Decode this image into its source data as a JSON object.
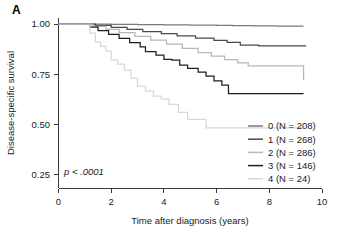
{
  "figure": {
    "panel_label": "A",
    "annotation": "p < .0001"
  },
  "chart_data": {
    "type": "line",
    "subtype": "kaplan-meier-step",
    "title": "",
    "xlabel": "Time after diagnosis (years)",
    "ylabel": "Disease-specific survival",
    "xlim": [
      0,
      10
    ],
    "ylim": [
      0.18,
      1.03
    ],
    "xticks": [
      0,
      2,
      4,
      6,
      8,
      10
    ],
    "xtick_labels": [
      "0",
      "2",
      "4",
      "6",
      "8",
      "10"
    ],
    "yticks": [
      0.25,
      0.5,
      0.75,
      1.0
    ],
    "ytick_labels": [
      "0.25",
      "0.50",
      "0.75",
      "1.00"
    ],
    "grid": false,
    "legend_position": "bottom-right",
    "annotation": "p < .0001",
    "series": [
      {
        "name": "0 (N = 208)",
        "group": "0",
        "n": 208,
        "color": "#7a7a7a",
        "final_value": 0.99,
        "x": [
          0.0,
          1.0,
          2.0,
          3.0,
          4.0,
          5.0,
          6.0,
          6.6,
          7.4,
          8.3,
          9.3
        ],
        "y": [
          1.0,
          1.0,
          0.998,
          0.997,
          0.996,
          0.995,
          0.993,
          0.992,
          0.991,
          0.99,
          0.99
        ]
      },
      {
        "name": "1 (N = 268)",
        "group": "1",
        "n": 268,
        "color": "#4a4a4a",
        "final_value": 0.89,
        "x": [
          0.0,
          1.0,
          1.4,
          2.0,
          2.6,
          3.2,
          3.9,
          4.5,
          5.2,
          5.9,
          6.4,
          6.9,
          7.6,
          8.6,
          9.4
        ],
        "y": [
          1.0,
          1.0,
          0.993,
          0.983,
          0.973,
          0.962,
          0.952,
          0.941,
          0.93,
          0.919,
          0.909,
          0.895,
          0.891,
          0.891,
          0.891
        ]
      },
      {
        "name": "2 (N = 286)",
        "group": "2",
        "n": 286,
        "color": "#b8b8b8",
        "final_value": 0.72,
        "x": [
          0.0,
          1.0,
          1.3,
          1.8,
          2.3,
          2.9,
          3.5,
          4.1,
          4.7,
          5.3,
          5.8,
          6.3,
          6.8,
          7.2,
          8.2,
          9.3
        ],
        "y": [
          1.0,
          1.0,
          0.988,
          0.973,
          0.957,
          0.938,
          0.92,
          0.9,
          0.879,
          0.858,
          0.84,
          0.822,
          0.806,
          0.791,
          0.791,
          0.72
        ]
      },
      {
        "name": "3 (N = 146)",
        "group": "3",
        "n": 146,
        "color": "#1f1f1f",
        "final_value": 0.65,
        "x": [
          0.0,
          1.0,
          1.2,
          1.5,
          1.9,
          2.3,
          2.7,
          3.1,
          3.3,
          3.7,
          4.0,
          4.3,
          4.6,
          4.9,
          5.3,
          5.6,
          5.9,
          6.2,
          6.45,
          7.2,
          8.3,
          9.3
        ],
        "y": [
          1.0,
          1.0,
          0.985,
          0.967,
          0.948,
          0.928,
          0.907,
          0.886,
          0.862,
          0.845,
          0.824,
          0.82,
          0.795,
          0.779,
          0.76,
          0.74,
          0.716,
          0.695,
          0.653,
          0.653,
          0.653,
          0.653
        ]
      },
      {
        "name": "4 (N = 24)",
        "group": "4",
        "n": 24,
        "color": "#d8d8d8",
        "final_value": 0.48,
        "x": [
          0.0,
          1.05,
          1.2,
          1.4,
          1.6,
          1.8,
          2.0,
          2.25,
          2.5,
          2.75,
          3.0,
          3.3,
          3.6,
          3.9,
          4.2,
          4.55,
          4.9,
          5.6,
          6.6,
          7.6,
          8.7,
          9.3
        ],
        "y": [
          1.0,
          1.0,
          0.955,
          0.91,
          0.888,
          0.865,
          0.82,
          0.8,
          0.77,
          0.73,
          0.69,
          0.665,
          0.64,
          0.625,
          0.6,
          0.56,
          0.525,
          0.482,
          0.482,
          0.482,
          0.482,
          0.482
        ]
      }
    ]
  },
  "legend": {
    "entries": [
      {
        "label": "0 (N = 208)",
        "color": "#7a7a7a"
      },
      {
        "label": "1 (N = 268)",
        "color": "#4a4a4a"
      },
      {
        "label": "2 (N = 286)",
        "color": "#b8b8b8"
      },
      {
        "label": "3 (N = 146)",
        "color": "#1f1f1f"
      },
      {
        "label": "4 (N = 24)",
        "color": "#d8d8d8"
      }
    ]
  }
}
